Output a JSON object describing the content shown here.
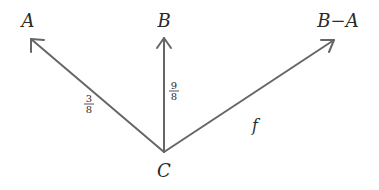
{
  "diagram": {
    "nodes": {
      "A": {
        "label": "A"
      },
      "B": {
        "label": "B"
      },
      "BminusA": {
        "label": "B−A"
      },
      "C": {
        "label": "C"
      }
    },
    "edges": [
      {
        "from": "C",
        "to": "A",
        "label_num": "3",
        "label_den": "8"
      },
      {
        "from": "C",
        "to": "B",
        "label_num": "9",
        "label_den": "8"
      },
      {
        "from": "C",
        "to": "B−A",
        "label": "f"
      }
    ],
    "colors": {
      "edge": "#666666",
      "text": "#2a2a2a",
      "background": "#ffffff"
    }
  }
}
